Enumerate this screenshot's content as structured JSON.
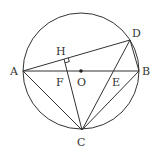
{
  "diagram": {
    "type": "geometry",
    "circle": {
      "center": "O",
      "cx": 81,
      "cy": 71,
      "r": 58
    },
    "points": {
      "A": {
        "x": 23,
        "y": 71,
        "label": "A",
        "lx": 10,
        "ly": 75
      },
      "B": {
        "x": 139,
        "y": 71,
        "label": "B",
        "lx": 142,
        "ly": 75
      },
      "C": {
        "x": 82,
        "y": 130,
        "label": "C",
        "lx": 77,
        "ly": 146
      },
      "D": {
        "x": 130,
        "y": 40,
        "label": "D",
        "lx": 132,
        "ly": 37
      },
      "H": {
        "x": 64,
        "y": 59,
        "label": "H",
        "lx": 56,
        "ly": 55
      },
      "F": {
        "x": 66,
        "y": 71,
        "label": "F",
        "lx": 56,
        "ly": 86
      },
      "O": {
        "x": 81,
        "y": 71,
        "label": "O",
        "lx": 77,
        "ly": 86
      },
      "E": {
        "x": 115,
        "y": 71,
        "label": "E",
        "lx": 112,
        "ly": 86
      }
    },
    "segments": [
      "AB",
      "AD",
      "AC",
      "BC",
      "BD",
      "CD",
      "CH"
    ],
    "right_angle_marker": "H",
    "center_dot": "O"
  }
}
